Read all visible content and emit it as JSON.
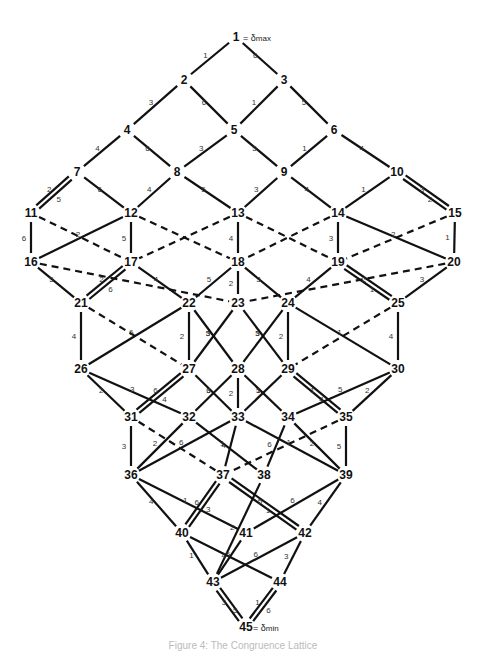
{
  "diagram": {
    "top_label": "1 = δmax",
    "bottom_label": "45 = δmin",
    "top_extreme": {
      "node": "1",
      "symbol": "δ",
      "sub": "max"
    },
    "bottom_extreme": {
      "node": "45",
      "symbol": "δ",
      "sub": "min"
    },
    "nodes": [
      {
        "id": "1",
        "x": 236,
        "y": 37
      },
      {
        "id": "2",
        "x": 184,
        "y": 80
      },
      {
        "id": "3",
        "x": 284,
        "y": 80
      },
      {
        "id": "4",
        "x": 127,
        "y": 130
      },
      {
        "id": "5",
        "x": 234,
        "y": 130
      },
      {
        "id": "6",
        "x": 334,
        "y": 130
      },
      {
        "id": "7",
        "x": 77,
        "y": 172
      },
      {
        "id": "8",
        "x": 177,
        "y": 172
      },
      {
        "id": "9",
        "x": 284,
        "y": 172
      },
      {
        "id": "10",
        "x": 397,
        "y": 172
      },
      {
        "id": "11",
        "x": 31,
        "y": 213
      },
      {
        "id": "12",
        "x": 131,
        "y": 213
      },
      {
        "id": "13",
        "x": 238,
        "y": 213
      },
      {
        "id": "14",
        "x": 338,
        "y": 213
      },
      {
        "id": "15",
        "x": 455,
        "y": 213
      },
      {
        "id": "16",
        "x": 31,
        "y": 262
      },
      {
        "id": "17",
        "x": 131,
        "y": 262
      },
      {
        "id": "18",
        "x": 238,
        "y": 262
      },
      {
        "id": "19",
        "x": 338,
        "y": 262
      },
      {
        "id": "20",
        "x": 454,
        "y": 262
      },
      {
        "id": "21",
        "x": 81,
        "y": 303
      },
      {
        "id": "22",
        "x": 189,
        "y": 303
      },
      {
        "id": "23",
        "x": 238,
        "y": 303
      },
      {
        "id": "24",
        "x": 288,
        "y": 303
      },
      {
        "id": "25",
        "x": 398,
        "y": 303
      },
      {
        "id": "26",
        "x": 81,
        "y": 369
      },
      {
        "id": "27",
        "x": 189,
        "y": 369
      },
      {
        "id": "28",
        "x": 238,
        "y": 369
      },
      {
        "id": "29",
        "x": 288,
        "y": 369
      },
      {
        "id": "30",
        "x": 398,
        "y": 369
      },
      {
        "id": "31",
        "x": 131,
        "y": 417
      },
      {
        "id": "32",
        "x": 189,
        "y": 417
      },
      {
        "id": "33",
        "x": 238,
        "y": 417
      },
      {
        "id": "34",
        "x": 288,
        "y": 417
      },
      {
        "id": "35",
        "x": 346,
        "y": 417
      },
      {
        "id": "36",
        "x": 131,
        "y": 475
      },
      {
        "id": "37",
        "x": 223,
        "y": 475
      },
      {
        "id": "38",
        "x": 264,
        "y": 475
      },
      {
        "id": "39",
        "x": 346,
        "y": 475
      },
      {
        "id": "40",
        "x": 182,
        "y": 533
      },
      {
        "id": "41",
        "x": 246,
        "y": 533
      },
      {
        "id": "42",
        "x": 305,
        "y": 533
      },
      {
        "id": "43",
        "x": 213,
        "y": 582
      },
      {
        "id": "44",
        "x": 280,
        "y": 582
      },
      {
        "id": "45",
        "x": 246,
        "y": 627
      }
    ],
    "edges": [
      {
        "a": "1",
        "b": "2",
        "label": "1",
        "style": "solid"
      },
      {
        "a": "1",
        "b": "3",
        "label": "6",
        "style": "solid"
      },
      {
        "a": "2",
        "b": "4",
        "label": "3",
        "style": "solid"
      },
      {
        "a": "2",
        "b": "5",
        "label": "6",
        "style": "solid"
      },
      {
        "a": "3",
        "b": "5",
        "label": "1",
        "style": "solid"
      },
      {
        "a": "3",
        "b": "6",
        "label": "5",
        "style": "solid"
      },
      {
        "a": "4",
        "b": "7",
        "label": "4",
        "style": "solid"
      },
      {
        "a": "4",
        "b": "8",
        "label": "6",
        "style": "solid"
      },
      {
        "a": "5",
        "b": "8",
        "label": "3",
        "style": "solid"
      },
      {
        "a": "5",
        "b": "9",
        "label": "5",
        "style": "solid"
      },
      {
        "a": "6",
        "b": "9",
        "label": "1",
        "style": "solid"
      },
      {
        "a": "6",
        "b": "10",
        "label": "4",
        "style": "solid"
      },
      {
        "a": "7",
        "b": "11",
        "label": "2",
        "style": "double",
        "label2": "5"
      },
      {
        "a": "7",
        "b": "12",
        "label": "6",
        "style": "solid"
      },
      {
        "a": "8",
        "b": "12",
        "label": "4",
        "style": "solid"
      },
      {
        "a": "8",
        "b": "13",
        "label": "5",
        "style": "solid"
      },
      {
        "a": "9",
        "b": "13",
        "label": "3",
        "style": "solid"
      },
      {
        "a": "9",
        "b": "14",
        "label": "4",
        "style": "solid"
      },
      {
        "a": "10",
        "b": "14",
        "label": "1",
        "style": "solid"
      },
      {
        "a": "10",
        "b": "15",
        "label": "3",
        "style": "double",
        "label2": "2"
      },
      {
        "a": "11",
        "b": "16",
        "label": "6",
        "style": "solid"
      },
      {
        "a": "11",
        "b": "17",
        "label": "",
        "style": "dashed"
      },
      {
        "a": "12",
        "b": "16",
        "label": "2",
        "style": "solid"
      },
      {
        "a": "12",
        "b": "17",
        "label": "5",
        "style": "solid"
      },
      {
        "a": "12",
        "b": "18",
        "label": "",
        "style": "dashed"
      },
      {
        "a": "13",
        "b": "17",
        "label": "",
        "style": "dashed"
      },
      {
        "a": "13",
        "b": "18",
        "label": "4",
        "style": "solid"
      },
      {
        "a": "13",
        "b": "19",
        "label": "",
        "style": "dashed"
      },
      {
        "a": "14",
        "b": "18",
        "label": "",
        "style": "dashed"
      },
      {
        "a": "14",
        "b": "19",
        "label": "3",
        "style": "solid"
      },
      {
        "a": "14",
        "b": "20",
        "label": "2",
        "style": "solid"
      },
      {
        "a": "15",
        "b": "19",
        "label": "",
        "style": "dashed"
      },
      {
        "a": "15",
        "b": "20",
        "label": "1",
        "style": "solid"
      },
      {
        "a": "16",
        "b": "21",
        "label": "5",
        "style": "solid"
      },
      {
        "a": "16",
        "b": "23",
        "label": "",
        "style": "dashed"
      },
      {
        "a": "17",
        "b": "21",
        "label": "2",
        "style": "double",
        "label2": "6"
      },
      {
        "a": "17",
        "b": "22",
        "label": "4",
        "style": "solid"
      },
      {
        "a": "18",
        "b": "22",
        "label": "5",
        "style": "solid"
      },
      {
        "a": "18",
        "b": "23",
        "label": "2",
        "style": "solid"
      },
      {
        "a": "18",
        "b": "24",
        "label": "3",
        "style": "solid"
      },
      {
        "a": "19",
        "b": "24",
        "label": "4",
        "style": "solid"
      },
      {
        "a": "19",
        "b": "25",
        "label": "2",
        "style": "double",
        "label2": "1"
      },
      {
        "a": "20",
        "b": "23",
        "label": "",
        "style": "dashed"
      },
      {
        "a": "20",
        "b": "25",
        "label": "3",
        "style": "solid"
      },
      {
        "a": "21",
        "b": "26",
        "label": "4",
        "style": "solid"
      },
      {
        "a": "21",
        "b": "27",
        "label": "",
        "style": "dashed"
      },
      {
        "a": "22",
        "b": "26",
        "label": "6",
        "style": "solid"
      },
      {
        "a": "22",
        "b": "27",
        "label": "2",
        "style": "solid"
      },
      {
        "a": "22",
        "b": "28",
        "label": "3",
        "style": "solid"
      },
      {
        "a": "23",
        "b": "27",
        "label": "5",
        "style": "solid"
      },
      {
        "a": "23",
        "b": "29",
        "label": "3",
        "style": "solid"
      },
      {
        "a": "24",
        "b": "28",
        "label": "5",
        "style": "solid"
      },
      {
        "a": "24",
        "b": "29",
        "label": "2",
        "style": "solid"
      },
      {
        "a": "24",
        "b": "30",
        "label": "1",
        "style": "solid"
      },
      {
        "a": "25",
        "b": "29",
        "label": "",
        "style": "dashed"
      },
      {
        "a": "25",
        "b": "30",
        "label": "4",
        "style": "solid"
      },
      {
        "a": "26",
        "b": "31",
        "label": "2",
        "style": "solid"
      },
      {
        "a": "26",
        "b": "32",
        "label": "3",
        "style": "solid"
      },
      {
        "a": "27",
        "b": "31",
        "label": "6",
        "style": "double",
        "label2": "4"
      },
      {
        "a": "27",
        "b": "33",
        "label": "3",
        "style": "solid"
      },
      {
        "a": "28",
        "b": "32",
        "label": "6",
        "style": "solid"
      },
      {
        "a": "28",
        "b": "33",
        "label": "2",
        "style": "solid"
      },
      {
        "a": "28",
        "b": "34",
        "label": "1",
        "style": "solid"
      },
      {
        "a": "29",
        "b": "33",
        "label": "5",
        "style": "solid"
      },
      {
        "a": "29",
        "b": "35",
        "label": "1",
        "style": "double",
        "label2": "4"
      },
      {
        "a": "30",
        "b": "34",
        "label": "5",
        "style": "solid"
      },
      {
        "a": "30",
        "b": "35",
        "label": "2",
        "style": "solid"
      },
      {
        "a": "31",
        "b": "36",
        "label": "3",
        "style": "solid"
      },
      {
        "a": "31",
        "b": "37",
        "label": "",
        "style": "dashed"
      },
      {
        "a": "32",
        "b": "36",
        "label": "2",
        "style": "solid"
      },
      {
        "a": "32",
        "b": "38",
        "label": "1",
        "style": "solid"
      },
      {
        "a": "33",
        "b": "36",
        "label": "6",
        "style": "solid"
      },
      {
        "a": "33",
        "b": "37",
        "label": "4",
        "style": "solid"
      },
      {
        "a": "33",
        "b": "39",
        "label": "1",
        "style": "solid"
      },
      {
        "a": "34",
        "b": "38",
        "label": "6",
        "style": "solid"
      },
      {
        "a": "34",
        "b": "39",
        "label": "2",
        "style": "solid"
      },
      {
        "a": "35",
        "b": "37",
        "label": "",
        "style": "dashed"
      },
      {
        "a": "35",
        "b": "39",
        "label": "5",
        "style": "solid"
      },
      {
        "a": "36",
        "b": "40",
        "label": "4",
        "style": "solid"
      },
      {
        "a": "36",
        "b": "41",
        "label": "1",
        "style": "solid"
      },
      {
        "a": "37",
        "b": "40",
        "label": "6",
        "style": "double",
        "label2": "3"
      },
      {
        "a": "37",
        "b": "42",
        "label": "5",
        "style": "double",
        "label2": "1"
      },
      {
        "a": "38",
        "b": "43",
        "label": "2",
        "style": "solid"
      },
      {
        "a": "39",
        "b": "41",
        "label": "6",
        "style": "solid"
      },
      {
        "a": "39",
        "b": "42",
        "label": "4",
        "style": "solid"
      },
      {
        "a": "40",
        "b": "43",
        "label": "1",
        "style": "solid"
      },
      {
        "a": "40",
        "b": "44",
        "label": "5",
        "style": "solid"
      },
      {
        "a": "41",
        "b": "43",
        "label": "4",
        "style": "solid"
      },
      {
        "a": "42",
        "b": "43",
        "label": "6",
        "style": "solid"
      },
      {
        "a": "42",
        "b": "44",
        "label": "3",
        "style": "solid"
      },
      {
        "a": "43",
        "b": "45",
        "label": "3",
        "style": "double",
        "label2": "5"
      },
      {
        "a": "44",
        "b": "45",
        "label": "1",
        "style": "double",
        "label2": "6"
      }
    ]
  },
  "caption": "Figure 4: The Congruence Lattice"
}
